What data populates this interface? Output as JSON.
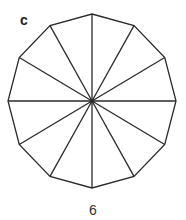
{
  "figure": {
    "panel_label": "c",
    "caption": "6",
    "shape": "dodecagon",
    "sides": 12,
    "center": [
      92,
      101
    ],
    "radius_x": 84,
    "radius_y": 87,
    "stroke": "#2a2a2a"
  }
}
